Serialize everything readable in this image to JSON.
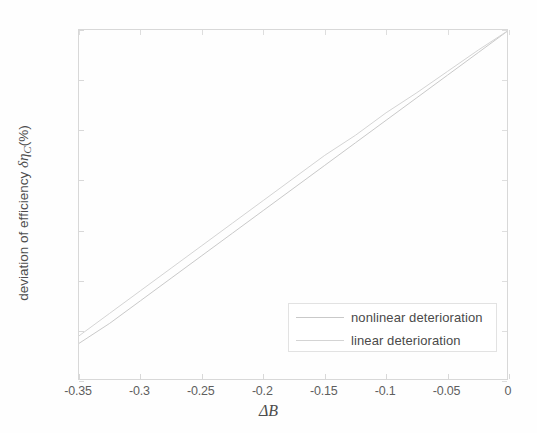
{
  "chart_data": {
    "type": "line",
    "title": "",
    "xlabel": "ΔB",
    "xlabel_parts": {
      "delta": "Δ",
      "variable": "B"
    },
    "ylabel": "deviation of efficiency δηC(%)",
    "ylabel_parts": {
      "prefix": "deviation of efficiency ",
      "symbol": "δη",
      "subscript": "C",
      "suffix": "(%)"
    },
    "xlim": [
      -0.35,
      0
    ],
    "ylim": [
      -1.4,
      0
    ],
    "xticks": [
      -0.35,
      -0.3,
      -0.25,
      -0.2,
      -0.15,
      -0.1,
      -0.05,
      0
    ],
    "xticklabels": [
      "-0.35",
      "-0.3",
      "-0.25",
      "-0.2",
      "-0.15",
      "-0.1",
      "-0.05",
      "0"
    ],
    "yticks": [
      0,
      -0.2,
      -0.4,
      -0.6,
      -0.8,
      -1,
      -1.2,
      -1.4
    ],
    "yticklabels": [
      "0",
      "-0.2",
      "-0.4",
      "-0.6",
      "-0.8",
      "-1",
      "-1.2",
      "-1.4"
    ],
    "grid": false,
    "legend_position": "lower right",
    "series": [
      {
        "name": "nonlinear deterioration",
        "color": "#c9c9c9",
        "style": "solid",
        "x": [
          -0.35,
          -0.325,
          -0.3,
          -0.275,
          -0.25,
          -0.225,
          -0.2,
          -0.175,
          -0.15,
          -0.125,
          -0.1,
          -0.075,
          -0.05,
          -0.025,
          0
        ],
        "y": [
          -1.25,
          -1.17,
          -1.08,
          -0.99,
          -0.9,
          -0.81,
          -0.72,
          -0.63,
          -0.54,
          -0.45,
          -0.36,
          -0.27,
          -0.18,
          -0.09,
          0
        ]
      },
      {
        "name": "linear deterioration",
        "color": "#d4d4d4",
        "style": "solid",
        "x": [
          -0.35,
          -0.325,
          -0.3,
          -0.275,
          -0.25,
          -0.225,
          -0.2,
          -0.175,
          -0.15,
          -0.125,
          -0.1,
          -0.075,
          -0.05,
          -0.025,
          0
        ],
        "y": [
          -1.22,
          -1.13,
          -1.04,
          -0.95,
          -0.86,
          -0.77,
          -0.68,
          -0.59,
          -0.5,
          -0.42,
          -0.33,
          -0.25,
          -0.165,
          -0.08,
          0
        ]
      }
    ]
  },
  "legend": {
    "entries": [
      {
        "label": "nonlinear deterioration"
      },
      {
        "label": "linear deterioration"
      }
    ]
  },
  "colors": {
    "axis": "#d8d8d8",
    "tick_text": "#5f5f5f",
    "label_text": "#4d4d4d",
    "background": "#ffffff",
    "series_nonlinear": "#c9c9c9",
    "series_linear": "#d4d4d4"
  }
}
